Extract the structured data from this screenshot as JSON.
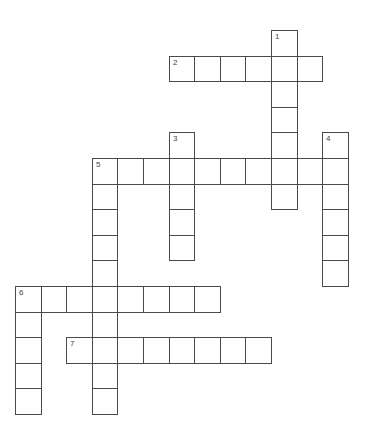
{
  "puzzle": {
    "type": "crossword",
    "grid": {
      "origin_x": 15,
      "origin_y": 30,
      "cell_size": 25.6,
      "line_color": "#4a4a4a"
    },
    "entries": [
      {
        "number": 1,
        "direction": "down",
        "row": 0,
        "col": 10,
        "length": 7
      },
      {
        "number": 2,
        "direction": "across",
        "row": 1,
        "col": 6,
        "length": 6
      },
      {
        "number": 3,
        "direction": "down",
        "row": 4,
        "col": 6,
        "length": 5
      },
      {
        "number": 4,
        "direction": "down",
        "row": 4,
        "col": 12,
        "length": 6
      },
      {
        "number": 5,
        "direction": "across",
        "row": 5,
        "col": 3,
        "length": 10
      },
      {
        "number": 5,
        "direction": "down",
        "row": 5,
        "col": 3,
        "length": 10
      },
      {
        "number": 6,
        "direction": "across",
        "row": 10,
        "col": 0,
        "length": 8
      },
      {
        "number": 6,
        "direction": "down",
        "row": 10,
        "col": 0,
        "length": 5
      },
      {
        "number": 7,
        "direction": "across",
        "row": 12,
        "col": 2,
        "length": 8
      }
    ]
  }
}
